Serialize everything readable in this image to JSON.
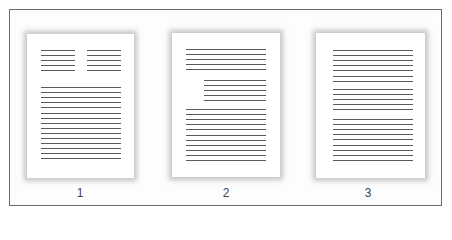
{
  "figure": {
    "pages": [
      {
        "label": "1",
        "layout": "two-column header then single column",
        "blocks": [
          {
            "name": "left-column",
            "lines": 5
          },
          {
            "name": "right-column",
            "lines": 5
          },
          {
            "name": "body",
            "lines": 15
          }
        ]
      },
      {
        "label": "2",
        "layout": "full paragraph, indented block, full paragraph",
        "blocks": [
          {
            "name": "top-paragraph",
            "lines": 5
          },
          {
            "name": "indented-block",
            "lines": 5
          },
          {
            "name": "body",
            "lines": 11
          }
        ]
      },
      {
        "label": "3",
        "layout": "three full-width paragraphs",
        "blocks": [
          {
            "name": "paragraph-1",
            "lines": 7
          },
          {
            "name": "paragraph-2",
            "lines": 5
          },
          {
            "name": "paragraph-3",
            "lines": 9
          }
        ]
      }
    ],
    "colors": {
      "line": "#5a5a5a",
      "border": "#6a6a6a",
      "page": "#ffffff"
    }
  }
}
